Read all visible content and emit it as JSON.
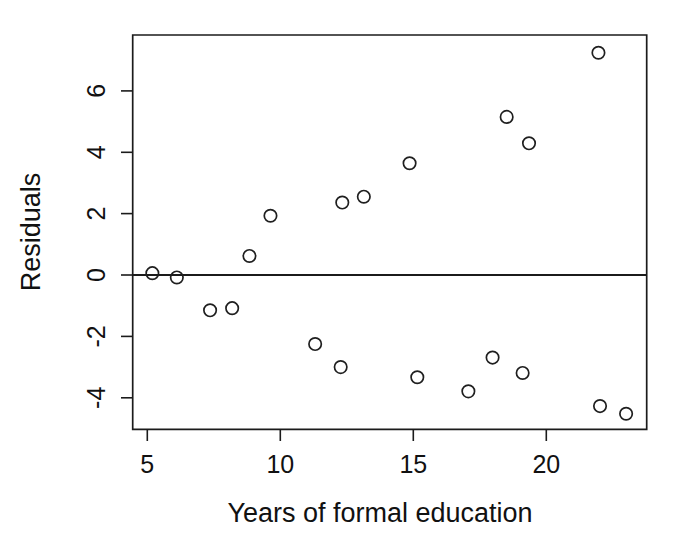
{
  "chart_data": {
    "type": "scatter",
    "title": "",
    "xlabel": "Years of formal education",
    "ylabel": "Residuals",
    "xlim": [
      4.43,
      23.75
    ],
    "ylim": [
      -4.83,
      7.82
    ],
    "xticks": [
      5,
      10,
      15,
      20
    ],
    "xtick_labels": [
      "5",
      "10",
      "15",
      "20"
    ],
    "yticks": [
      -4,
      -2,
      0,
      2,
      4,
      6
    ],
    "ytick_labels": [
      "-4",
      "-2",
      "0",
      "2",
      "4",
      "6"
    ],
    "grid": false,
    "legend": null,
    "reference_lines": [
      {
        "orientation": "horizontal",
        "value": 0
      }
    ],
    "marker": "open-circle",
    "n_points": 18,
    "x": [
      5.19,
      6.11,
      7.36,
      8.19,
      8.84,
      9.63,
      11.31,
      12.27,
      12.33,
      13.14,
      14.86,
      15.15,
      17.07,
      17.98,
      18.51,
      19.11,
      19.35,
      21.96
    ],
    "y": [
      0.06,
      -0.08,
      -1.15,
      -1.08,
      0.62,
      1.93,
      -2.25,
      -3.0,
      2.36,
      2.55,
      3.64,
      -3.33,
      -3.79,
      -2.69,
      5.15,
      -3.19,
      4.29,
      7.24
    ],
    "points": [
      {
        "x": 5.19,
        "y": 0.06
      },
      {
        "x": 6.11,
        "y": -0.08
      },
      {
        "x": 7.36,
        "y": -1.15
      },
      {
        "x": 8.19,
        "y": -1.08
      },
      {
        "x": 8.84,
        "y": 0.62
      },
      {
        "x": 9.63,
        "y": 1.93
      },
      {
        "x": 11.31,
        "y": -2.25
      },
      {
        "x": 12.27,
        "y": -3.0
      },
      {
        "x": 12.33,
        "y": 2.36
      },
      {
        "x": 13.14,
        "y": 2.55
      },
      {
        "x": 14.86,
        "y": 3.64
      },
      {
        "x": 15.15,
        "y": -3.33
      },
      {
        "x": 17.07,
        "y": -3.79
      },
      {
        "x": 17.98,
        "y": -2.69
      },
      {
        "x": 18.51,
        "y": 5.15
      },
      {
        "x": 19.11,
        "y": -3.19
      },
      {
        "x": 19.35,
        "y": 4.29
      },
      {
        "x": 21.96,
        "y": 7.24
      },
      {
        "x": 22.02,
        "y": -4.27
      },
      {
        "x": 23.0,
        "y": -4.52
      }
    ],
    "colors": {
      "marker_stroke": "#1f1f1f",
      "marker_fill": "none",
      "axis": "#1b1b1b",
      "background": "#ffffff",
      "text": "#111111"
    }
  },
  "axes": {
    "x_title": "Years of formal education",
    "y_title": "Residuals"
  }
}
